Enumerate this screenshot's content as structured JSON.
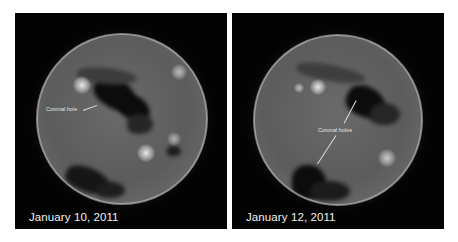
{
  "figure": {
    "panels": [
      {
        "id": "left",
        "date_label": "January 10, 2011",
        "annotation": "Coronal hole",
        "subject": "Sun (extreme ultraviolet image) showing coronal hole"
      },
      {
        "id": "right",
        "date_label": "January 12, 2011",
        "annotation": "Coronal holes",
        "subject": "Sun (extreme ultraviolet image) showing two coronal holes"
      }
    ],
    "colors": {
      "background": "#ffffff",
      "panel_bg": "#030303",
      "disc": "#5a5a5a",
      "corona": "#cfcfcf",
      "text": "#f2f2f2"
    }
  }
}
